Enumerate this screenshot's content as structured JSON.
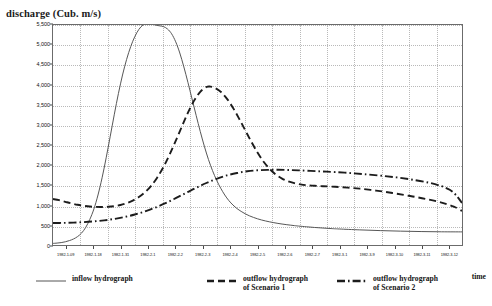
{
  "chart_data": {
    "type": "line",
    "title": "",
    "ylabel": "discharge (Cub. m/s)",
    "xlabel": "time",
    "ylim": [
      0,
      5500
    ],
    "y_ticks": [
      0,
      500,
      1000,
      1500,
      2000,
      2500,
      3000,
      3500,
      4000,
      4500,
      5000,
      5500
    ],
    "y_tick_labels": [
      "0",
      "500",
      "1,000",
      "1,500",
      "2,000",
      "2,500",
      "3,000",
      "3,500",
      "4,000",
      "4,500",
      "5,000",
      "5,500"
    ],
    "grid": true,
    "legend_position": "bottom",
    "x_tick_labels": [
      "1982-1-09",
      "1982-1-18",
      "1982-1-31",
      "1982-2-1",
      "1982-2-2",
      "1982-2-3",
      "1982-2-4",
      "1982-2-5",
      "1982-2-6",
      "1982-2-7",
      "1982-3-1",
      "1982-3-9",
      "1982-3-10",
      "1982-3-11",
      "1982-3-12"
    ],
    "series": [
      {
        "name": "inflow hydrograph",
        "style": "solid",
        "color": "#555555",
        "peak_value": 5540,
        "start_value": 40,
        "end_value": 330,
        "points": [
          [
            0,
            40
          ],
          [
            2,
            48
          ],
          [
            4,
            60
          ],
          [
            6,
            80
          ],
          [
            8,
            110
          ],
          [
            10,
            150
          ],
          [
            12,
            210
          ],
          [
            14,
            300
          ],
          [
            16,
            440
          ],
          [
            18,
            640
          ],
          [
            20,
            900
          ],
          [
            22,
            1250
          ],
          [
            24,
            1680
          ],
          [
            26,
            2180
          ],
          [
            28,
            2720
          ],
          [
            30,
            3270
          ],
          [
            32,
            3790
          ],
          [
            34,
            4250
          ],
          [
            36,
            4640
          ],
          [
            38,
            4960
          ],
          [
            40,
            5210
          ],
          [
            42,
            5390
          ],
          [
            44,
            5500
          ],
          [
            46,
            5540
          ],
          [
            48,
            5530
          ],
          [
            50,
            5500
          ],
          [
            52,
            5480
          ],
          [
            54,
            5460
          ],
          [
            56,
            5400
          ],
          [
            58,
            5280
          ],
          [
            60,
            5080
          ],
          [
            62,
            4800
          ],
          [
            64,
            4450
          ],
          [
            66,
            4060
          ],
          [
            68,
            3650
          ],
          [
            70,
            3240
          ],
          [
            72,
            2840
          ],
          [
            74,
            2470
          ],
          [
            76,
            2140
          ],
          [
            78,
            1860
          ],
          [
            80,
            1620
          ],
          [
            82,
            1420
          ],
          [
            84,
            1250
          ],
          [
            86,
            1110
          ],
          [
            88,
            1000
          ],
          [
            90,
            910
          ],
          [
            92,
            840
          ],
          [
            94,
            780
          ],
          [
            96,
            730
          ],
          [
            98,
            690
          ],
          [
            100,
            655
          ],
          [
            102,
            625
          ],
          [
            104,
            600
          ],
          [
            106,
            578
          ],
          [
            108,
            558
          ],
          [
            110,
            540
          ],
          [
            112,
            524
          ],
          [
            114,
            510
          ],
          [
            116,
            497
          ],
          [
            118,
            485
          ],
          [
            120,
            474
          ],
          [
            124,
            455
          ],
          [
            128,
            438
          ],
          [
            132,
            424
          ],
          [
            136,
            411
          ],
          [
            140,
            400
          ],
          [
            150,
            378
          ],
          [
            160,
            360
          ],
          [
            170,
            346
          ],
          [
            180,
            336
          ],
          [
            190,
            330
          ],
          [
            200,
            328
          ]
        ]
      },
      {
        "name": "outflow hydrograph of Scenario 1",
        "style": "dashed",
        "color": "#1c1c1c",
        "peak_value": 3960,
        "start_value": 1150,
        "end_value": 850,
        "points": [
          [
            0,
            1150
          ],
          [
            3,
            1120
          ],
          [
            6,
            1080
          ],
          [
            9,
            1040
          ],
          [
            12,
            1005
          ],
          [
            15,
            980
          ],
          [
            18,
            962
          ],
          [
            21,
            952
          ],
          [
            24,
            950
          ],
          [
            27,
            956
          ],
          [
            30,
            972
          ],
          [
            33,
            1000
          ],
          [
            36,
            1045
          ],
          [
            39,
            1110
          ],
          [
            42,
            1200
          ],
          [
            45,
            1320
          ],
          [
            48,
            1480
          ],
          [
            51,
            1690
          ],
          [
            54,
            1950
          ],
          [
            57,
            2260
          ],
          [
            60,
            2600
          ],
          [
            63,
            2960
          ],
          [
            66,
            3310
          ],
          [
            69,
            3610
          ],
          [
            72,
            3830
          ],
          [
            75,
            3950
          ],
          [
            77,
            3960
          ],
          [
            79,
            3930
          ],
          [
            82,
            3830
          ],
          [
            85,
            3660
          ],
          [
            88,
            3430
          ],
          [
            91,
            3160
          ],
          [
            94,
            2870
          ],
          [
            97,
            2580
          ],
          [
            100,
            2310
          ],
          [
            103,
            2080
          ],
          [
            106,
            1900
          ],
          [
            109,
            1760
          ],
          [
            112,
            1660
          ],
          [
            115,
            1590
          ],
          [
            118,
            1545
          ],
          [
            121,
            1515
          ],
          [
            124,
            1495
          ],
          [
            128,
            1480
          ],
          [
            132,
            1470
          ],
          [
            138,
            1455
          ],
          [
            144,
            1435
          ],
          [
            150,
            1408
          ],
          [
            158,
            1360
          ],
          [
            166,
            1300
          ],
          [
            174,
            1230
          ],
          [
            182,
            1155
          ],
          [
            190,
            1060
          ],
          [
            196,
            960
          ],
          [
            200,
            850
          ]
        ]
      },
      {
        "name": "outflow hydrograph of Scenario 2",
        "style": "dashdot",
        "color": "#1c1c1c",
        "peak_value": 1880,
        "start_value": 550,
        "end_value": 1050,
        "points": [
          [
            0,
            550
          ],
          [
            5,
            553
          ],
          [
            10,
            560
          ],
          [
            15,
            572
          ],
          [
            20,
            590
          ],
          [
            25,
            616
          ],
          [
            30,
            652
          ],
          [
            35,
            700
          ],
          [
            40,
            762
          ],
          [
            45,
            840
          ],
          [
            50,
            935
          ],
          [
            55,
            1045
          ],
          [
            60,
            1170
          ],
          [
            65,
            1300
          ],
          [
            70,
            1430
          ],
          [
            75,
            1550
          ],
          [
            80,
            1655
          ],
          [
            85,
            1740
          ],
          [
            90,
            1800
          ],
          [
            95,
            1845
          ],
          [
            100,
            1868
          ],
          [
            105,
            1878
          ],
          [
            110,
            1880
          ],
          [
            115,
            1875
          ],
          [
            120,
            1866
          ],
          [
            126,
            1852
          ],
          [
            132,
            1838
          ],
          [
            138,
            1822
          ],
          [
            145,
            1800
          ],
          [
            152,
            1772
          ],
          [
            160,
            1735
          ],
          [
            168,
            1690
          ],
          [
            176,
            1630
          ],
          [
            184,
            1555
          ],
          [
            190,
            1470
          ],
          [
            194,
            1380
          ],
          [
            197,
            1250
          ],
          [
            200,
            1050
          ]
        ]
      }
    ]
  },
  "legend": {
    "items": [
      {
        "label": "inflow hydrograph",
        "style": "solid"
      },
      {
        "label": "outflow hydrograph\nof Scenario 1",
        "style": "dashed"
      },
      {
        "label": "outflow hydrograph\nof Scenario 2",
        "style": "dashdot"
      }
    ]
  },
  "colors": {
    "inflow": "#555555",
    "scenario1": "#1c1c1c",
    "scenario2": "#1c1c1c",
    "frame": "#6b6b6b",
    "grid": "#b9b9b9"
  }
}
